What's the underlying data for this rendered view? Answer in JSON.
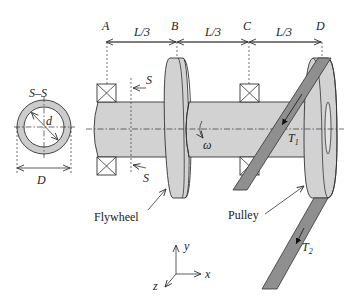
{
  "diagram": {
    "type": "shaft-assembly-schematic",
    "section": {
      "title": "S–S",
      "inner_diameter_label": "d",
      "outer_diameter_label": "D"
    },
    "stations": [
      {
        "id": "A",
        "label": "A"
      },
      {
        "id": "B",
        "label": "B"
      },
      {
        "id": "C",
        "label": "C"
      },
      {
        "id": "D",
        "label": "D"
      }
    ],
    "spans": [
      {
        "from": "A",
        "to": "B",
        "label": "L/3"
      },
      {
        "from": "B",
        "to": "C",
        "label": "L/3"
      },
      {
        "from": "C",
        "to": "D",
        "label": "L/3"
      }
    ],
    "section_cut_label": "S",
    "angular_velocity_label": "ω",
    "tensions": {
      "t1": {
        "base": "T",
        "sub": "1"
      },
      "t2": {
        "base": "T",
        "sub": "2"
      }
    },
    "callouts": {
      "flywheel": "Flywheel",
      "pulley": "Pulley"
    },
    "axes": {
      "x": "x",
      "y": "y",
      "z": "z"
    }
  }
}
